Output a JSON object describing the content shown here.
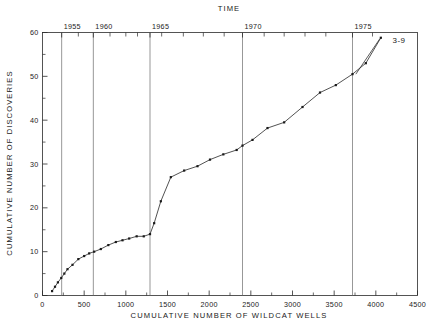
{
  "figure": {
    "background": "#ffffff",
    "line_color": "#333333",
    "marker_color": "#1a1a1a",
    "grid_color": "#6b6b6b",
    "axis_color": "#2b2b2b"
  },
  "chart_data": {
    "type": "line",
    "title": "",
    "top_axis_title": "TIME",
    "xlabel": "CUMULATIVE NUMBER OF WILDCAT WELLS",
    "ylabel": "CUMULATIVE NUMBER OF DISCOVERIES",
    "xlim": [
      0,
      4500
    ],
    "ylim": [
      0,
      60
    ],
    "xticks": [
      0,
      500,
      1000,
      1500,
      2000,
      2500,
      3000,
      3500,
      4000,
      4500
    ],
    "xticklabels": [
      "0",
      "500",
      "1000",
      "1500",
      "2000",
      "2500",
      "3000",
      "3500",
      "4000",
      "4500"
    ],
    "x_minor_interval": 250,
    "yticks": [
      0,
      10,
      20,
      30,
      40,
      50,
      60
    ],
    "yticklabels": [
      "0",
      "10",
      "20",
      "30",
      "40",
      "50",
      "60"
    ],
    "y_minor_interval": 5,
    "grid": false,
    "legend": "none",
    "annotations": [
      {
        "text": "3-9",
        "x": 4200,
        "y": 58.2,
        "points_to_x": 4060,
        "points_to_y": 58.8,
        "leader_from_x": 3760,
        "leader_from_y": 50.5
      }
    ],
    "top_axis": {
      "label": "TIME",
      "tick_years": [
        1955,
        1960,
        1965,
        1970,
        1975
      ],
      "tick_labels": [
        "1955",
        "1960",
        "1965",
        "1970",
        "1975"
      ],
      "gridline_x": [
        230,
        610,
        1290,
        2400,
        3720
      ],
      "minor_tick_x": [
        430,
        810,
        1000,
        1140,
        1430,
        1690,
        1930,
        2180,
        2660,
        2900,
        3150,
        3400,
        3960
      ],
      "description": "Vertical year gridlines mark calendar time along the cumulative-wells axis"
    },
    "series": [
      {
        "name": "3-9",
        "x": [
          115,
          150,
          185,
          225,
          262,
          300,
          360,
          430,
          500,
          560,
          620,
          700,
          790,
          880,
          960,
          1040,
          1130,
          1215,
          1290,
          1340,
          1420,
          1540,
          1700,
          1860,
          2010,
          2170,
          2330,
          2400,
          2520,
          2700,
          2900,
          3120,
          3330,
          3520,
          3720,
          3880,
          4060
        ],
        "y": [
          1.0,
          2.0,
          3.0,
          4.0,
          5.0,
          6.0,
          7.0,
          8.3,
          9.0,
          9.6,
          10.0,
          10.6,
          11.5,
          12.2,
          12.6,
          13.0,
          13.5,
          13.5,
          14.0,
          16.5,
          21.5,
          27.0,
          28.5,
          29.5,
          31.0,
          32.2,
          33.2,
          34.2,
          35.5,
          38.2,
          39.5,
          43.0,
          46.3,
          48.0,
          50.5,
          53.0,
          58.8
        ]
      }
    ]
  }
}
